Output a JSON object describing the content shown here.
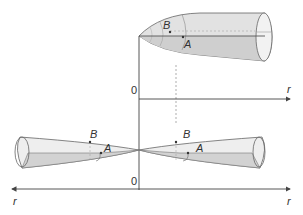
{
  "colors": {
    "stroke": "#555555",
    "fill_shade": "#d6d6d6",
    "fill_light": "#ececec",
    "axis": "#444444"
  },
  "top_figure": {
    "origin_label": "0",
    "axis_label": "r",
    "point_b": "B",
    "point_a": "A"
  },
  "bottom_figure": {
    "origin_label": "0",
    "axis_label_left": "r",
    "axis_label_right": "r",
    "left_point_b": "B",
    "left_point_a": "A",
    "right_point_b": "B",
    "right_point_a": "A"
  }
}
